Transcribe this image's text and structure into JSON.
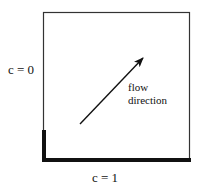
{
  "diagram": {
    "type": "boundary-condition schematic",
    "domain_box": {
      "stroke_color": "#333333"
    },
    "boundaries": {
      "left_label": "c = 0",
      "bottom_label": "c = 1",
      "thick_boundary_color": "#111111"
    },
    "arrow": {
      "label_line1": "flow",
      "label_line2": "direction",
      "color": "#111111"
    }
  }
}
